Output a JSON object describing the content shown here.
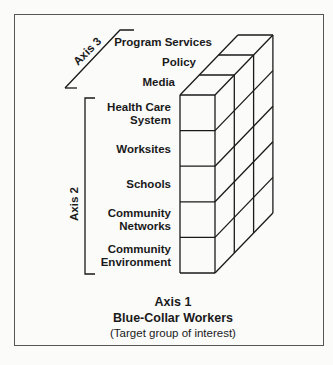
{
  "axis3": {
    "title": "Axis 3",
    "items": [
      "Program Services",
      "Policy",
      "Media"
    ]
  },
  "axis2": {
    "title": "Axis 2",
    "items": [
      [
        "Health Care",
        "System"
      ],
      [
        "Worksites"
      ],
      [
        "Schools"
      ],
      [
        "Community",
        "Networks"
      ],
      [
        "Community",
        "Environment"
      ]
    ]
  },
  "axis1": {
    "title": "Axis 1",
    "subtitle": "Blue-Collar Workers",
    "note": "(Target group of interest)"
  }
}
